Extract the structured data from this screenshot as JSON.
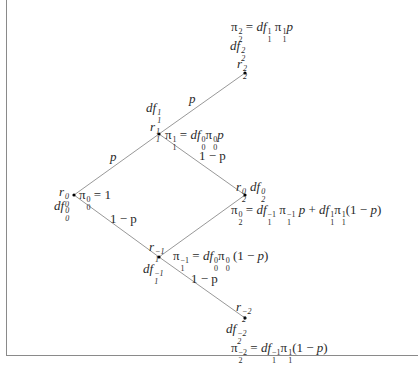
{
  "diagram": {
    "type": "binomial-tree",
    "nodes": [
      {
        "id": "n0_0",
        "x": 74,
        "y": 195,
        "rate": "r_0^0",
        "discount": "df_0^0",
        "price": "π_0^0 = 1"
      },
      {
        "id": "n1_1",
        "x": 159,
        "y": 134,
        "rate": "r_1^1",
        "discount": "df_1^1",
        "price": "π_1^1 = df_0^0 π_0^0 p"
      },
      {
        "id": "n1_m1",
        "x": 159,
        "y": 257,
        "rate": "r_1^-1",
        "discount": "df_1^-1",
        "price": "π_1^-1 = df_0^0 π_0^0 (1 − p)"
      },
      {
        "id": "n2_2",
        "x": 245,
        "y": 73,
        "rate": "r_2^2",
        "discount": "df_2^2",
        "price": "π_2^2 = df_1^1 π_1^1 p"
      },
      {
        "id": "n2_0",
        "x": 245,
        "y": 195,
        "rate": "r_2^0",
        "discount": "df_2^0",
        "price": "π_2^0 = df_1^-1 π_1^-1 p + df_1^1 π_1^1 (1 − p)"
      },
      {
        "id": "n2_m2",
        "x": 245,
        "y": 318,
        "rate": "r_2^-2",
        "discount": "df_2^-2",
        "price": "π_2^-2 = df_1^-1 π_1^1 (1 − p)"
      }
    ],
    "edges": [
      {
        "from": "n0_0",
        "to": "n1_1",
        "label": "p"
      },
      {
        "from": "n0_0",
        "to": "n1_m1",
        "label": "1 − p"
      },
      {
        "from": "n1_1",
        "to": "n2_2",
        "label": "p"
      },
      {
        "from": "n1_1",
        "to": "n2_0",
        "label": "1 − p"
      },
      {
        "from": "n1_m1",
        "to": "n2_0",
        "label": ""
      },
      {
        "from": "n1_m1",
        "to": "n2_m2",
        "label": "1 − p"
      }
    ]
  },
  "text": {
    "pi": "π",
    "eq": " = ",
    "one": "1",
    "p": "p",
    "one_minus_p": "1 − p",
    "r": "r",
    "df": "df",
    "plus": " + ",
    "open": "(1 − ",
    "close": ")",
    "sup_0": "0",
    "sup_1": "1",
    "sup_2": "2",
    "sup_m1": "−1",
    "sup_m2": "−2",
    "sub_0": "0",
    "sub_1": "1",
    "sub_2": "2"
  },
  "colors": {
    "line": "#8c8c8c",
    "node": "#000000",
    "text": "#2a2a2a",
    "frame": "#8a8a8a"
  }
}
